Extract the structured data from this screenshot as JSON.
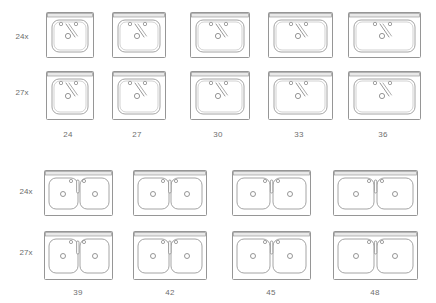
{
  "diagram": {
    "type": "sink-size-matrix",
    "line_color": "#8a8a8a",
    "deck_color": "#e9e9e9",
    "background": "#ffffff",
    "label_color": "#6b6b6b"
  },
  "sections": [
    {
      "id": "single-bowl",
      "row_labels": [
        "24x",
        "27x"
      ],
      "column_labels": [
        "24",
        "27",
        "30",
        "33",
        "36"
      ],
      "units": [
        {
          "row": "24x",
          "col": "24",
          "bowls": 1,
          "width_in": 24,
          "depth_in": 24,
          "faucet": "3-hole-diagonal-spout"
        },
        {
          "row": "24x",
          "col": "27",
          "bowls": 1,
          "width_in": 27,
          "depth_in": 24,
          "faucet": "3-hole-diagonal-spout"
        },
        {
          "row": "24x",
          "col": "30",
          "bowls": 1,
          "width_in": 30,
          "depth_in": 24,
          "faucet": "3-hole-diagonal-spout"
        },
        {
          "row": "24x",
          "col": "33",
          "bowls": 1,
          "width_in": 33,
          "depth_in": 24,
          "faucet": "3-hole-diagonal-spout"
        },
        {
          "row": "24x",
          "col": "36",
          "bowls": 1,
          "width_in": 36,
          "depth_in": 24,
          "faucet": "3-hole-diagonal-spout"
        },
        {
          "row": "27x",
          "col": "24",
          "bowls": 1,
          "width_in": 24,
          "depth_in": 27,
          "faucet": "3-hole-diagonal-spout"
        },
        {
          "row": "27x",
          "col": "27",
          "bowls": 1,
          "width_in": 27,
          "depth_in": 27,
          "faucet": "3-hole-diagonal-spout"
        },
        {
          "row": "27x",
          "col": "30",
          "bowls": 1,
          "width_in": 30,
          "depth_in": 27,
          "faucet": "3-hole-diagonal-spout"
        },
        {
          "row": "27x",
          "col": "33",
          "bowls": 1,
          "width_in": 33,
          "depth_in": 27,
          "faucet": "3-hole-diagonal-spout"
        },
        {
          "row": "27x",
          "col": "36",
          "bowls": 1,
          "width_in": 36,
          "depth_in": 27,
          "faucet": "3-hole-diagonal-spout"
        }
      ]
    },
    {
      "id": "double-bowl",
      "row_labels": [
        "24x",
        "27x"
      ],
      "column_labels": [
        "39",
        "42",
        "45",
        "48"
      ],
      "units": [
        {
          "row": "24x",
          "col": "39",
          "bowls": 2,
          "width_in": 39,
          "depth_in": 24,
          "faucet": "3-hole-vertical-spout"
        },
        {
          "row": "24x",
          "col": "42",
          "bowls": 2,
          "width_in": 42,
          "depth_in": 24,
          "faucet": "3-hole-vertical-spout"
        },
        {
          "row": "24x",
          "col": "45",
          "bowls": 2,
          "width_in": 45,
          "depth_in": 24,
          "faucet": "3-hole-vertical-spout"
        },
        {
          "row": "24x",
          "col": "48",
          "bowls": 2,
          "width_in": 48,
          "depth_in": 24,
          "faucet": "3-hole-vertical-spout"
        },
        {
          "row": "27x",
          "col": "39",
          "bowls": 2,
          "width_in": 39,
          "depth_in": 27,
          "faucet": "3-hole-vertical-spout"
        },
        {
          "row": "27x",
          "col": "42",
          "bowls": 2,
          "width_in": 42,
          "depth_in": 27,
          "faucet": "3-hole-vertical-spout"
        },
        {
          "row": "27x",
          "col": "45",
          "bowls": 2,
          "width_in": 45,
          "depth_in": 27,
          "faucet": "3-hole-vertical-spout"
        },
        {
          "row": "27x",
          "col": "48",
          "bowls": 2,
          "width_in": 48,
          "depth_in": 27,
          "faucet": "3-hole-vertical-spout"
        }
      ]
    }
  ],
  "labels": {
    "s1_row1": "24x",
    "s1_row2": "27x",
    "s1_col1": "24",
    "s1_col2": "27",
    "s1_col3": "30",
    "s1_col4": "33",
    "s1_col5": "36",
    "s2_row1": "24x",
    "s2_row2": "27x",
    "s2_col1": "39",
    "s2_col2": "42",
    "s2_col3": "45",
    "s2_col4": "48"
  }
}
